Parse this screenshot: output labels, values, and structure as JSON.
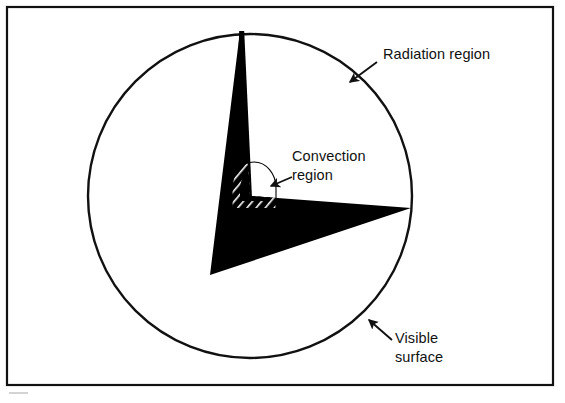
{
  "figure": {
    "background_color": "#ffffff",
    "ink_color": "#111111",
    "frame": {
      "x": 7,
      "y": 7,
      "width": 546,
      "height": 378,
      "stroke_width": 2.2
    },
    "star": {
      "center_x": 250,
      "center_y": 196,
      "radius": 162,
      "outline_stroke_width": 2.4,
      "fill": "#ffffff"
    },
    "cutaway_wedge": {
      "fill": "#000000",
      "description": "black cutaway sector revealing the interior"
    },
    "convection_dome": {
      "fill": "#000000",
      "hatch_color": "#ffffff",
      "description": "hatched dome marking the convection region boundary"
    }
  },
  "labels": [
    {
      "id": "radiation-region",
      "lines": [
        "Radiation region"
      ],
      "text_x": 383,
      "text_y": 59,
      "anchor": "start",
      "leader": {
        "x1": 377,
        "y1": 62,
        "x2": 347,
        "y2": 84
      },
      "arrow": {
        "x": 347,
        "y": 84,
        "angle": 143
      }
    },
    {
      "id": "convection-region",
      "lines": [
        "Convection",
        "region"
      ],
      "text_x": 292,
      "text_y": 161,
      "line_height": 19,
      "anchor": "start",
      "leader": {
        "x1": 289,
        "y1": 176,
        "x2": 268,
        "y2": 185
      },
      "arrow": {
        "x": 268,
        "y": 185,
        "angle": 202
      }
    },
    {
      "id": "visible-surface",
      "lines": [
        "Visible",
        "surface"
      ],
      "text_x": 395,
      "text_y": 343,
      "line_height": 19,
      "anchor": "start",
      "leader": {
        "x1": 390,
        "y1": 338,
        "x2": 366,
        "y2": 318
      },
      "arrow": {
        "x": 366,
        "y": 318,
        "angle": 220
      }
    }
  ]
}
